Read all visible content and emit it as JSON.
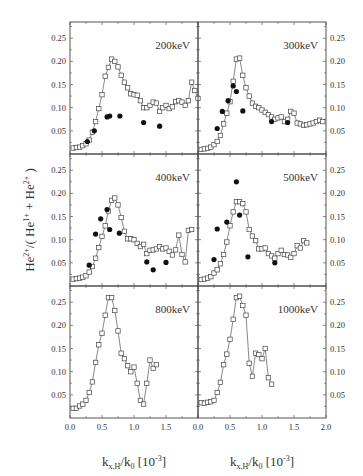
{
  "chart_data": {
    "type": "scatter",
    "layout": {
      "grid": "3x2 shared axes",
      "xlim": [
        0,
        2.0
      ],
      "ylim": [
        0,
        0.285
      ],
      "x_ticks": [
        0.0,
        0.5,
        1.0,
        1.5,
        2.0
      ],
      "x_tick_labels_left": [
        "0.0",
        "0.5",
        "1.0",
        "1.5"
      ],
      "x_tick_labels_right": [
        "0.0",
        "0.5",
        "1.0",
        "1.5",
        "2.0"
      ],
      "y_ticks": [
        0.05,
        0.1,
        0.15,
        0.2,
        0.25
      ],
      "y_tick_labels": [
        "0.05",
        "0.10",
        "0.15",
        "0.20",
        "0.25"
      ],
      "grid_lines": false,
      "legend": "none"
    },
    "ylabel": "He2+/(He1+ + He2+)",
    "ylabel_parts": {
      "base1": "He",
      "sup1": "2+",
      "mid": "/( He",
      "sup2": "1+",
      "mid2": " + He",
      "sup3": "2+",
      "end": " )"
    },
    "xlabel": "kx,H/k0 [10-3]",
    "xlabel_parts": {
      "k": "k",
      "sub1": "x,H",
      "slash": "/k",
      "sub2": "0",
      "bracket": " [10",
      "sup": "-3",
      "close": "]"
    },
    "panels": [
      {
        "label": "200keV",
        "series": [
          {
            "name": "open squares (line)",
            "marker": "open-square",
            "x": [
              0.05,
              0.1,
              0.15,
              0.2,
              0.25,
              0.3,
              0.35,
              0.4,
              0.45,
              0.5,
              0.55,
              0.6,
              0.65,
              0.7,
              0.75,
              0.8,
              0.85,
              0.9,
              0.95,
              1.0,
              1.05,
              1.1,
              1.15,
              1.2,
              1.25,
              1.3,
              1.35,
              1.4,
              1.45,
              1.5,
              1.55,
              1.6,
              1.65,
              1.7,
              1.75,
              1.8,
              1.85,
              1.9,
              1.95,
              2.0
            ],
            "y": [
              0.013,
              0.014,
              0.015,
              0.018,
              0.022,
              0.03,
              0.047,
              0.07,
              0.098,
              0.128,
              0.168,
              0.187,
              0.205,
              0.2,
              0.188,
              0.17,
              0.155,
              0.143,
              0.13,
              0.128,
              0.127,
              0.115,
              0.1,
              0.1,
              0.105,
              0.112,
              0.11,
              0.092,
              0.1,
              0.105,
              0.098,
              0.102,
              0.113,
              0.115,
              0.112,
              0.105,
              0.115,
              0.155,
              0.137,
              0.12
            ]
          },
          {
            "name": "filled circles",
            "marker": "filled-circle",
            "x": [
              0.27,
              0.38,
              0.58,
              0.62,
              0.78,
              1.15,
              1.4
            ],
            "y": [
              0.027,
              0.05,
              0.08,
              0.082,
              0.082,
              0.068,
              0.06
            ]
          }
        ]
      },
      {
        "label": "300keV",
        "series": [
          {
            "name": "open squares (line)",
            "marker": "open-square",
            "x": [
              0.05,
              0.1,
              0.15,
              0.2,
              0.25,
              0.3,
              0.35,
              0.4,
              0.45,
              0.5,
              0.55,
              0.6,
              0.65,
              0.7,
              0.75,
              0.8,
              0.85,
              0.9,
              0.95,
              1.0,
              1.05,
              1.1,
              1.15,
              1.2,
              1.25,
              1.3,
              1.35,
              1.4,
              1.45,
              1.5,
              1.55,
              1.6,
              1.65,
              1.7,
              1.75,
              1.8,
              1.85,
              1.9,
              1.95
            ],
            "y": [
              0.01,
              0.011,
              0.012,
              0.015,
              0.02,
              0.027,
              0.04,
              0.065,
              0.088,
              0.113,
              0.157,
              0.205,
              0.207,
              0.17,
              0.143,
              0.125,
              0.11,
              0.103,
              0.1,
              0.095,
              0.09,
              0.085,
              0.08,
              0.075,
              0.078,
              0.08,
              0.07,
              0.075,
              0.092,
              0.088,
              0.067,
              0.065,
              0.062,
              0.063,
              0.065,
              0.067,
              0.07,
              0.073,
              0.07
            ]
          },
          {
            "name": "filled circles",
            "marker": "filled-circle",
            "x": [
              0.3,
              0.38,
              0.47,
              0.55,
              0.6,
              0.7,
              1.15,
              1.4
            ],
            "y": [
              0.055,
              0.092,
              0.115,
              0.147,
              0.135,
              0.093,
              0.07,
              0.068
            ]
          }
        ]
      },
      {
        "label": "400keV",
        "series": [
          {
            "name": "open squares (line)",
            "marker": "open-square",
            "x": [
              0.05,
              0.1,
              0.15,
              0.2,
              0.25,
              0.3,
              0.35,
              0.4,
              0.45,
              0.5,
              0.55,
              0.6,
              0.65,
              0.7,
              0.75,
              0.8,
              0.85,
              0.9,
              0.95,
              1.0,
              1.05,
              1.1,
              1.15,
              1.2,
              1.25,
              1.3,
              1.35,
              1.4,
              1.45,
              1.5,
              1.55,
              1.6,
              1.65,
              1.7,
              1.75,
              1.8,
              1.85,
              1.9
            ],
            "y": [
              0.015,
              0.016,
              0.017,
              0.019,
              0.022,
              0.03,
              0.042,
              0.06,
              0.083,
              0.107,
              0.13,
              0.162,
              0.185,
              0.19,
              0.175,
              0.148,
              0.118,
              0.102,
              0.102,
              0.1,
              0.092,
              0.085,
              0.09,
              0.07,
              0.077,
              0.078,
              0.08,
              0.085,
              0.08,
              0.082,
              0.075,
              0.067,
              0.078,
              0.11,
              0.068,
              0.052,
              0.12,
              0.122
            ]
          },
          {
            "name": "filled circles",
            "marker": "filled-circle",
            "x": [
              0.3,
              0.4,
              0.48,
              0.58,
              0.62,
              0.77,
              1.2,
              1.3,
              1.5
            ],
            "y": [
              0.045,
              0.112,
              0.145,
              0.165,
              0.122,
              0.114,
              0.052,
              0.035,
              0.051
            ]
          }
        ]
      },
      {
        "label": "500keV",
        "series": [
          {
            "name": "open squares (line)",
            "marker": "open-square",
            "x": [
              0.05,
              0.1,
              0.15,
              0.2,
              0.25,
              0.3,
              0.35,
              0.4,
              0.45,
              0.5,
              0.55,
              0.6,
              0.65,
              0.7,
              0.75,
              0.8,
              0.85,
              0.9,
              0.95,
              1.0,
              1.05,
              1.1,
              1.15,
              1.2,
              1.25,
              1.3,
              1.35,
              1.4,
              1.45,
              1.5,
              1.55,
              1.6,
              1.65,
              1.7
            ],
            "y": [
              0.014,
              0.015,
              0.017,
              0.02,
              0.028,
              0.035,
              0.048,
              0.068,
              0.095,
              0.13,
              0.16,
              0.182,
              0.182,
              0.178,
              0.16,
              0.122,
              0.108,
              0.098,
              0.08,
              0.08,
              0.082,
              0.07,
              0.065,
              0.06,
              0.07,
              0.077,
              0.068,
              0.067,
              0.062,
              0.07,
              0.087,
              0.082,
              0.098,
              0.093
            ]
          },
          {
            "name": "filled circles",
            "marker": "filled-circle",
            "x": [
              0.25,
              0.3,
              0.45,
              0.6,
              0.65,
              0.78,
              1.2
            ],
            "y": [
              0.057,
              0.123,
              0.138,
              0.225,
              0.153,
              0.063,
              0.05
            ]
          }
        ]
      },
      {
        "label": "800keV",
        "series": [
          {
            "name": "open squares (line)",
            "marker": "open-square",
            "x": [
              0.05,
              0.1,
              0.15,
              0.2,
              0.25,
              0.3,
              0.35,
              0.4,
              0.45,
              0.5,
              0.55,
              0.6,
              0.65,
              0.7,
              0.75,
              0.8,
              0.85,
              0.9,
              0.95,
              1.0,
              1.05,
              1.1,
              1.15,
              1.2,
              1.25,
              1.3,
              1.35
            ],
            "y": [
              0.021,
              0.021,
              0.026,
              0.03,
              0.038,
              0.055,
              0.078,
              0.12,
              0.158,
              0.183,
              0.222,
              0.26,
              0.26,
              0.232,
              0.188,
              0.14,
              0.128,
              0.113,
              0.1,
              0.11,
              0.075,
              0.038,
              0.03,
              0.075,
              0.125,
              0.107,
              0.115
            ]
          }
        ]
      },
      {
        "label": "1000keV",
        "series": [
          {
            "name": "open squares (line)",
            "marker": "open-square",
            "x": [
              0.05,
              0.1,
              0.15,
              0.2,
              0.25,
              0.3,
              0.35,
              0.4,
              0.45,
              0.5,
              0.55,
              0.6,
              0.65,
              0.7,
              0.75,
              0.8,
              0.85,
              0.9,
              0.95,
              1.0,
              1.05,
              1.1,
              1.15
            ],
            "y": [
              0.033,
              0.032,
              0.034,
              0.035,
              0.038,
              0.055,
              0.077,
              0.115,
              0.138,
              0.17,
              0.213,
              0.26,
              0.263,
              0.243,
              0.222,
              0.118,
              0.09,
              0.14,
              0.137,
              0.128,
              0.15,
              0.087,
              0.073
            ]
          }
        ]
      }
    ]
  }
}
